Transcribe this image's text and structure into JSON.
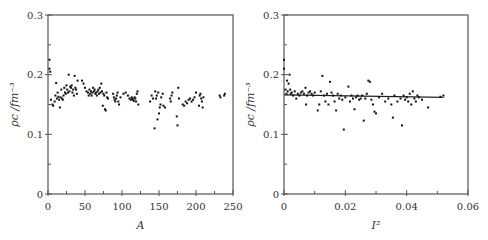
{
  "chart_data": [
    {
      "type": "scatter",
      "title": "",
      "xlabel": "A",
      "ylabel": "ρc /fm⁻³",
      "xlim": [
        0,
        250
      ],
      "ylim": [
        0,
        0.3
      ],
      "xticks": [
        0,
        50,
        100,
        150,
        200,
        250
      ],
      "xtick_labels": [
        "0",
        "50",
        "100",
        "150",
        "200",
        "250"
      ],
      "yticks": [
        0,
        0.1,
        0.2,
        0.3
      ],
      "ytick_labels": [
        "0",
        "0.1",
        "0.2",
        "0.3"
      ],
      "grid": false,
      "legend": null,
      "note": "Hundreds of points; approx values. Mean ~0.165; outliers 0.11-0.13 near A~145-178; high points ~0.21-0.225 at A<5",
      "points": [
        [
          2,
          0.225
        ],
        [
          2,
          0.21
        ],
        [
          3,
          0.205
        ],
        [
          4,
          0.158
        ],
        [
          6,
          0.15
        ],
        [
          7,
          0.148
        ],
        [
          9,
          0.155
        ],
        [
          10,
          0.165
        ],
        [
          11,
          0.186
        ],
        [
          12,
          0.16
        ],
        [
          13,
          0.17
        ],
        [
          14,
          0.163
        ],
        [
          15,
          0.158
        ],
        [
          16,
          0.145
        ],
        [
          17,
          0.162
        ],
        [
          18,
          0.175
        ],
        [
          19,
          0.16
        ],
        [
          20,
          0.158
        ],
        [
          21,
          0.165
        ],
        [
          22,
          0.178
        ],
        [
          23,
          0.17
        ],
        [
          24,
          0.168
        ],
        [
          25,
          0.182
        ],
        [
          26,
          0.175
        ],
        [
          27,
          0.17
        ],
        [
          28,
          0.2
        ],
        [
          29,
          0.172
        ],
        [
          30,
          0.18
        ],
        [
          31,
          0.178
        ],
        [
          32,
          0.182
        ],
        [
          33,
          0.17
        ],
        [
          34,
          0.175
        ],
        [
          35,
          0.165
        ],
        [
          36,
          0.198
        ],
        [
          37,
          0.178
        ],
        [
          38,
          0.175
        ],
        [
          39,
          0.168
        ],
        [
          40,
          0.19
        ],
        [
          46,
          0.19
        ],
        [
          48,
          0.185
        ],
        [
          50,
          0.178
        ],
        [
          52,
          0.172
        ],
        [
          54,
          0.17
        ],
        [
          55,
          0.165
        ],
        [
          56,
          0.175
        ],
        [
          57,
          0.168
        ],
        [
          58,
          0.172
        ],
        [
          59,
          0.165
        ],
        [
          60,
          0.17
        ],
        [
          61,
          0.178
        ],
        [
          62,
          0.172
        ],
        [
          63,
          0.175
        ],
        [
          64,
          0.168
        ],
        [
          65,
          0.17
        ],
        [
          66,
          0.165
        ],
        [
          67,
          0.172
        ],
        [
          68,
          0.175
        ],
        [
          69,
          0.168
        ],
        [
          70,
          0.178
        ],
        [
          71,
          0.17
        ],
        [
          72,
          0.185
        ],
        [
          73,
          0.172
        ],
        [
          74,
          0.148
        ],
        [
          75,
          0.168
        ],
        [
          76,
          0.165
        ],
        [
          77,
          0.142
        ],
        [
          78,
          0.14
        ],
        [
          79,
          0.17
        ],
        [
          80,
          0.162
        ],
        [
          81,
          0.16
        ],
        [
          88,
          0.168
        ],
        [
          89,
          0.162
        ],
        [
          90,
          0.158
        ],
        [
          91,
          0.155
        ],
        [
          92,
          0.16
        ],
        [
          93,
          0.165
        ],
        [
          94,
          0.17
        ],
        [
          95,
          0.155
        ],
        [
          96,
          0.15
        ],
        [
          98,
          0.162
        ],
        [
          102,
          0.168
        ],
        [
          105,
          0.17
        ],
        [
          108,
          0.165
        ],
        [
          110,
          0.16
        ],
        [
          112,
          0.158
        ],
        [
          113,
          0.162
        ],
        [
          114,
          0.16
        ],
        [
          115,
          0.158
        ],
        [
          116,
          0.156
        ],
        [
          117,
          0.162
        ],
        [
          118,
          0.16
        ],
        [
          119,
          0.155
        ],
        [
          120,
          0.168
        ],
        [
          121,
          0.172
        ],
        [
          122,
          0.15
        ],
        [
          138,
          0.155
        ],
        [
          140,
          0.165
        ],
        [
          142,
          0.16
        ],
        [
          144,
          0.11
        ],
        [
          145,
          0.172
        ],
        [
          146,
          0.16
        ],
        [
          147,
          0.165
        ],
        [
          148,
          0.125
        ],
        [
          149,
          0.17
        ],
        [
          150,
          0.135
        ],
        [
          151,
          0.145
        ],
        [
          152,
          0.15
        ],
        [
          153,
          0.162
        ],
        [
          155,
          0.168
        ],
        [
          156,
          0.148
        ],
        [
          158,
          0.145
        ],
        [
          165,
          0.16
        ],
        [
          166,
          0.155
        ],
        [
          167,
          0.165
        ],
        [
          168,
          0.17
        ],
        [
          174,
          0.13
        ],
        [
          175,
          0.115
        ],
        [
          176,
          0.178
        ],
        [
          177,
          0.16
        ],
        [
          182,
          0.15
        ],
        [
          184,
          0.148
        ],
        [
          186,
          0.155
        ],
        [
          188,
          0.152
        ],
        [
          190,
          0.158
        ],
        [
          192,
          0.16
        ],
        [
          194,
          0.155
        ],
        [
          196,
          0.158
        ],
        [
          198,
          0.162
        ],
        [
          200,
          0.17
        ],
        [
          204,
          0.148
        ],
        [
          205,
          0.165
        ],
        [
          206,
          0.168
        ],
        [
          207,
          0.16
        ],
        [
          208,
          0.155
        ],
        [
          209,
          0.145
        ],
        [
          210,
          0.162
        ],
        [
          232,
          0.165
        ],
        [
          233,
          0.162
        ],
        [
          238,
          0.165
        ],
        [
          239,
          0.168
        ]
      ]
    },
    {
      "type": "scatter",
      "title": "",
      "xlabel": "I²",
      "ylabel": "ρc /fm⁻³",
      "xlim": [
        0,
        0.06
      ],
      "ylim": [
        0,
        0.3
      ],
      "xticks": [
        0,
        0.02,
        0.04,
        0.06
      ],
      "xtick_labels": [
        "0",
        "0.02",
        "0.04",
        "0.06"
      ],
      "yticks": [
        0,
        0.1,
        0.2,
        0.3
      ],
      "ytick_labels": [
        "0",
        "0.1",
        "0.2",
        "0.3"
      ],
      "grid": false,
      "legend": null,
      "fit_line": {
        "x": [
          0,
          0.052
        ],
        "y": [
          0.166,
          0.162
        ]
      },
      "note": "Hundreds of points; approx values. Horizontal linear fit ~0.165 slightly decreasing",
      "points": [
        [
          0.0,
          0.225
        ],
        [
          0.0,
          0.21
        ],
        [
          0.0005,
          0.175
        ],
        [
          0.0008,
          0.168
        ],
        [
          0.001,
          0.19
        ],
        [
          0.0012,
          0.172
        ],
        [
          0.0015,
          0.185
        ],
        [
          0.0018,
          0.2
        ],
        [
          0.002,
          0.175
        ],
        [
          0.0022,
          0.168
        ],
        [
          0.0025,
          0.17
        ],
        [
          0.003,
          0.165
        ],
        [
          0.0035,
          0.172
        ],
        [
          0.004,
          0.16
        ],
        [
          0.0045,
          0.168
        ],
        [
          0.005,
          0.165
        ],
        [
          0.0055,
          0.17
        ],
        [
          0.006,
          0.172
        ],
        [
          0.0065,
          0.168
        ],
        [
          0.007,
          0.178
        ],
        [
          0.0072,
          0.15
        ],
        [
          0.0075,
          0.165
        ],
        [
          0.008,
          0.17
        ],
        [
          0.0085,
          0.172
        ],
        [
          0.009,
          0.168
        ],
        [
          0.0095,
          0.165
        ],
        [
          0.01,
          0.17
        ],
        [
          0.011,
          0.14
        ],
        [
          0.0115,
          0.15
        ],
        [
          0.012,
          0.172
        ],
        [
          0.0125,
          0.198
        ],
        [
          0.013,
          0.165
        ],
        [
          0.0135,
          0.155
        ],
        [
          0.014,
          0.168
        ],
        [
          0.0145,
          0.15
        ],
        [
          0.015,
          0.188
        ],
        [
          0.0155,
          0.17
        ],
        [
          0.016,
          0.165
        ],
        [
          0.0165,
          0.155
        ],
        [
          0.017,
          0.14
        ],
        [
          0.0175,
          0.168
        ],
        [
          0.018,
          0.16
        ],
        [
          0.0185,
          0.165
        ],
        [
          0.019,
          0.158
        ],
        [
          0.0195,
          0.108
        ],
        [
          0.02,
          0.162
        ],
        [
          0.021,
          0.18
        ],
        [
          0.0215,
          0.155
        ],
        [
          0.022,
          0.165
        ],
        [
          0.0225,
          0.16
        ],
        [
          0.023,
          0.142
        ],
        [
          0.0235,
          0.162
        ],
        [
          0.024,
          0.165
        ],
        [
          0.0245,
          0.158
        ],
        [
          0.025,
          0.16
        ],
        [
          0.0255,
          0.165
        ],
        [
          0.026,
          0.123
        ],
        [
          0.0265,
          0.16
        ],
        [
          0.027,
          0.168
        ],
        [
          0.0275,
          0.19
        ],
        [
          0.028,
          0.188
        ],
        [
          0.0285,
          0.158
        ],
        [
          0.029,
          0.15
        ],
        [
          0.0295,
          0.138
        ],
        [
          0.03,
          0.135
        ],
        [
          0.031,
          0.162
        ],
        [
          0.032,
          0.168
        ],
        [
          0.033,
          0.155
        ],
        [
          0.034,
          0.16
        ],
        [
          0.035,
          0.15
        ],
        [
          0.0355,
          0.128
        ],
        [
          0.036,
          0.165
        ],
        [
          0.037,
          0.155
        ],
        [
          0.038,
          0.16
        ],
        [
          0.0385,
          0.115
        ],
        [
          0.039,
          0.165
        ],
        [
          0.0395,
          0.158
        ],
        [
          0.04,
          0.162
        ],
        [
          0.0405,
          0.155
        ],
        [
          0.041,
          0.168
        ],
        [
          0.0415,
          0.15
        ],
        [
          0.042,
          0.172
        ],
        [
          0.0425,
          0.16
        ],
        [
          0.043,
          0.155
        ],
        [
          0.0435,
          0.165
        ],
        [
          0.044,
          0.162
        ],
        [
          0.045,
          0.158
        ],
        [
          0.047,
          0.145
        ],
        [
          0.051,
          0.163
        ],
        [
          0.052,
          0.165
        ]
      ]
    }
  ]
}
